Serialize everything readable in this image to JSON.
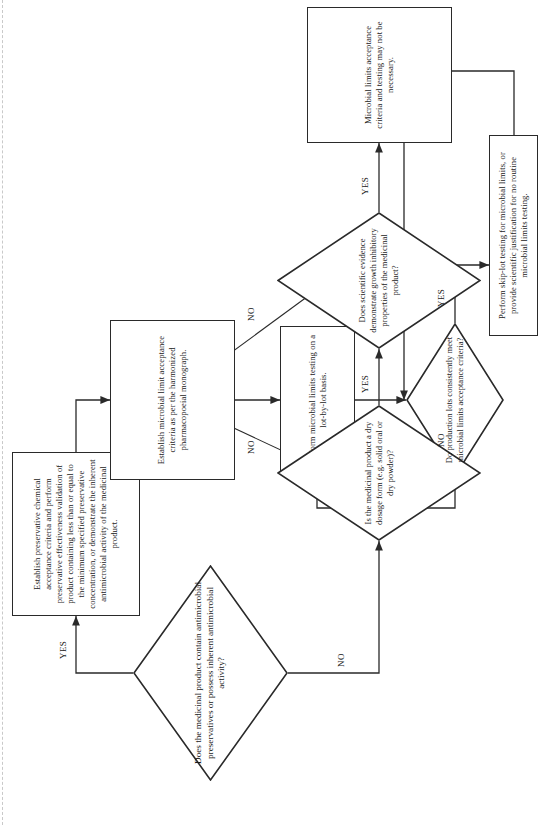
{
  "document": {
    "type": "flowchart",
    "orientation": "rotated-landscape",
    "title_text": ""
  },
  "nodes": {
    "decision_preservatives": {
      "shape": "diamond",
      "text": "Does the medicinal product contain antimicrobial preservatives or possess inherent antimicrobial activity?"
    },
    "process_preservative": {
      "shape": "process",
      "text": "Establish preservative chemical acceptance criteria and perform preservative effectiveness validation of product containing less than or equal to the minimum specified preservative concentration, or demonstrate the inherent antimicrobial activity of the medicinal product."
    },
    "process_microbial_limit": {
      "shape": "process",
      "text": "Establish microbial limit  acceptance criteria as per the harmonized pharmacopoeial monograph."
    },
    "process_lot_by_lot": {
      "shape": "process",
      "text": "Perform microbial limits testing on a lot-by-lot basis."
    },
    "decision_production_lots": {
      "shape": "diamond",
      "text": "Do production lots consistently meet microbial limits acceptance criteria?"
    },
    "process_skip_lot": {
      "shape": "process",
      "text": "Perform skip-lot testing for microbial limits, or provide scientific justification for no routine microbial limits testing."
    },
    "decision_dry_dosage": {
      "shape": "diamond",
      "text": "Is the medicinal product a dry dosage form (e.g. solid oral or dry powder)?"
    },
    "decision_growth_inhibitory": {
      "shape": "diamond",
      "text": "Does scientific evidence demonstrate growth inhibitory properties of the medicinal product?"
    },
    "process_not_necessary": {
      "shape": "process",
      "text": "Microbial limits acceptance criteria and testing may not be necessary."
    }
  },
  "edge_labels": {
    "preservatives_yes": "YES",
    "preservatives_no": "NO",
    "dry_dosage_yes": "YES",
    "dry_dosage_no": "NO",
    "growth_yes": "YES",
    "growth_no": "NO",
    "production_lots_yes": "YES",
    "production_lots_no": "NO"
  },
  "colors": {
    "stroke": "#2a2a2a",
    "text": "#1b1b1b",
    "background": "#ffffff",
    "dashed_guide": "#c9c9c9"
  }
}
